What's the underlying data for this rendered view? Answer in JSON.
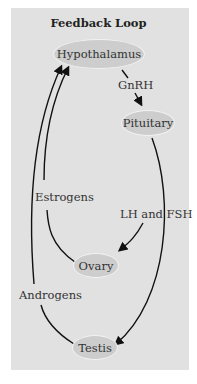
{
  "title": "Feedback Loop",
  "nodes": {
    "hypothalamus": "Hypothalamus",
    "pituitary": "Pituitary",
    "ovary": "Ovary",
    "testis": "Testis"
  },
  "edges": {
    "gnrh": "GnRH",
    "lh_fsh": "LH and FSH",
    "estrogens": "Estrogens",
    "androgens": "Androgens"
  },
  "colors": {
    "panel": "#e1e1e1",
    "node_fill": "#cdcdcd",
    "node_border": "#f2f2f2",
    "arrow": "#111111"
  }
}
